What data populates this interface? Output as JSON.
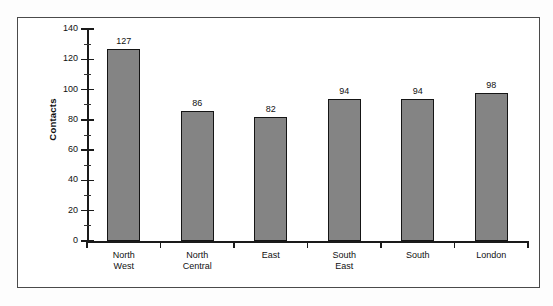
{
  "chart_data": {
    "type": "bar",
    "title": "",
    "subtitle": "",
    "xlabel": "",
    "ylabel": "Contacts",
    "categories": [
      "North West",
      "North Central",
      "East",
      "South East",
      "South",
      "London"
    ],
    "category_lines": [
      [
        "North",
        "West"
      ],
      [
        "North",
        "Central"
      ],
      [
        "East"
      ],
      [
        "South",
        "East"
      ],
      [
        "South"
      ],
      [
        "London"
      ]
    ],
    "values": [
      127,
      86,
      82,
      94,
      94,
      98
    ],
    "value_labels": [
      "127",
      "86",
      "82",
      "94",
      "94",
      "98"
    ],
    "ylim": [
      0,
      140
    ],
    "y_ticks": [
      0,
      20,
      40,
      60,
      80,
      100,
      120,
      140
    ],
    "y_tick_labels": [
      "0",
      "20",
      "40",
      "60",
      "80",
      "100",
      "120",
      "140"
    ],
    "y_minor_ticks": [
      10,
      30,
      50,
      70,
      90,
      110,
      130
    ],
    "grid": false,
    "legend": false,
    "legend_position": "none",
    "bar_color": "#848484",
    "bar_edge_color": "#151515",
    "axis_color": "#1a1a1a",
    "text_color": "#111111",
    "plot_background": "#ffffff",
    "frame_color": "#4a4a4a"
  }
}
